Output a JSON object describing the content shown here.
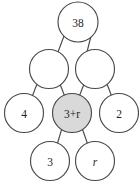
{
  "diagram": {
    "type": "number-pyramid",
    "stroke_color": "#4a4a4a",
    "background_color": "#ffffff",
    "shaded_fill_color": "#d9d9d9",
    "plain_fill_color": "#ffffff",
    "rows": [
      {
        "row_index": 0,
        "nodes": [
          {
            "id": "apex",
            "label": "38",
            "shaded": false,
            "italic": false,
            "empty": false,
            "cx": 78,
            "cy": 22,
            "r": 20
          }
        ]
      },
      {
        "row_index": 1,
        "nodes": [
          {
            "id": "mid-left",
            "label": "",
            "shaded": false,
            "italic": false,
            "empty": true,
            "cx": 49,
            "cy": 69,
            "r": 19.5
          },
          {
            "id": "mid-right",
            "label": "",
            "shaded": false,
            "italic": false,
            "empty": true,
            "cx": 95,
            "cy": 69,
            "r": 19.5
          }
        ]
      },
      {
        "row_index": 2,
        "nodes": [
          {
            "id": "low-left",
            "label": "4",
            "shaded": false,
            "italic": false,
            "empty": false,
            "cx": 24,
            "cy": 113,
            "r": 19.5
          },
          {
            "id": "low-center",
            "label": "3+r",
            "shaded": true,
            "italic": false,
            "empty": false,
            "cx": 72,
            "cy": 113,
            "r": 19.5
          },
          {
            "id": "low-right",
            "label": "2",
            "shaded": false,
            "italic": false,
            "empty": false,
            "cx": 119,
            "cy": 113,
            "r": 19.5
          }
        ]
      },
      {
        "row_index": 3,
        "nodes": [
          {
            "id": "base-left",
            "label": "3",
            "shaded": false,
            "italic": false,
            "empty": false,
            "cx": 50,
            "cy": 161,
            "r": 19.5
          },
          {
            "id": "base-right",
            "label": "r",
            "shaded": false,
            "italic": true,
            "empty": false,
            "cx": 95,
            "cy": 161,
            "r": 19.5
          }
        ]
      }
    ],
    "connectors": [
      {
        "id": "apex-to-mid-left",
        "from": "apex",
        "to": "mid-left",
        "x1": 64,
        "y1": 36,
        "x2": 58,
        "y2": 52
      },
      {
        "id": "apex-to-mid-right",
        "from": "apex",
        "to": "mid-right",
        "x1": 91,
        "y1": 36,
        "x2": 87,
        "y2": 52
      },
      {
        "id": "mid-left-to-low-left",
        "from": "mid-left",
        "to": "low-left",
        "x1": 37,
        "y1": 84,
        "x2": 32,
        "y2": 97
      },
      {
        "id": "mid-left-to-low-center",
        "from": "mid-left",
        "to": "low-center",
        "x1": 60,
        "y1": 84,
        "x2": 65,
        "y2": 97
      },
      {
        "id": "mid-right-to-low-center",
        "from": "mid-right",
        "to": "low-center",
        "x1": 84,
        "y1": 84,
        "x2": 79,
        "y2": 97
      },
      {
        "id": "mid-right-to-low-right",
        "from": "mid-right",
        "to": "low-right",
        "x1": 107,
        "y1": 84,
        "x2": 112,
        "y2": 97
      },
      {
        "id": "low-center-to-base-left",
        "from": "low-center",
        "to": "base-left",
        "x1": 62,
        "y1": 128,
        "x2": 57,
        "y2": 145
      },
      {
        "id": "low-center-to-base-right",
        "from": "low-center",
        "to": "base-right",
        "x1": 82,
        "y1": 128,
        "x2": 88,
        "y2": 145
      }
    ]
  }
}
